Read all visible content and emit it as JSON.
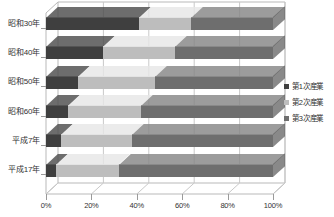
{
  "chart_data": {
    "type": "bar",
    "orientation": "horizontal",
    "stacked": true,
    "stack_mode": "percent",
    "style": "3d",
    "title": "",
    "xlabel": "",
    "ylabel": "",
    "categories": [
      "昭和30年",
      "昭和40年",
      "昭和50年",
      "昭和60年",
      "平成7年",
      "平成17年"
    ],
    "series": [
      {
        "name": "第1次産業",
        "color": "#3f3f3f",
        "values": [
          41.0,
          25.0,
          14.0,
          9.5,
          6.5,
          4.5
        ]
      },
      {
        "name": "第2次産業",
        "color": "#bdbdbd",
        "values": [
          23.0,
          32.0,
          34.0,
          32.5,
          31.5,
          27.5
        ]
      },
      {
        "name": "第3次産業",
        "color": "#6e6e6e",
        "values": [
          36.0,
          43.0,
          52.0,
          58.0,
          62.0,
          68.0
        ]
      }
    ],
    "xticks": [
      "0%",
      "20%",
      "40%",
      "60%",
      "80%",
      "100%"
    ],
    "xtick_values": [
      0,
      20,
      40,
      60,
      80,
      100
    ],
    "xlim": [
      0,
      100
    ],
    "grid": true,
    "legend_position": "right",
    "legend": [
      "第1次産業",
      "第2次産業",
      "第3次産業"
    ],
    "colors": {
      "series1": "#3f3f3f",
      "series2": "#bdbdbd",
      "series3": "#6e6e6e",
      "grid": "#c9c9c9",
      "axis": "#b9b9b9",
      "background": "#ffffff"
    }
  }
}
